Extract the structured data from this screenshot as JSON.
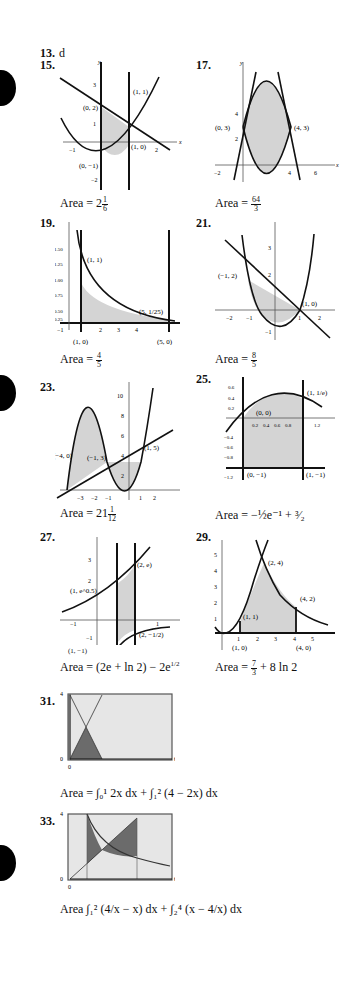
{
  "page": {
    "problems": [
      {
        "id": "13",
        "label": "13.",
        "answer": "d"
      },
      {
        "id": "15",
        "label": "15.",
        "area_prefix": "Area = ",
        "area_whole": "2",
        "area_num": "1",
        "area_den": "6",
        "points": [
          "(0, 2)",
          "(1, 1)",
          "(1, 0)",
          "(0, −1)"
        ],
        "xticks": [
          "−1",
          "2"
        ],
        "yticks": [
          "3",
          "1",
          "−2"
        ]
      },
      {
        "id": "17",
        "label": "17.",
        "area_prefix": "Area = ",
        "area_num": "64",
        "area_den": "3",
        "points": [
          "(0, 3)",
          "(4, 3)"
        ],
        "xticks": [
          "−2",
          "4",
          "6"
        ],
        "yticks": [
          "4",
          "2"
        ]
      },
      {
        "id": "19",
        "label": "19.",
        "area_prefix": "Area = ",
        "area_num": "4",
        "area_den": "5",
        "points": [
          "(1, 1)",
          "(5, 1/25)",
          "(1, 0)",
          "(5, 0)"
        ],
        "xticks": [
          "−1",
          "2",
          "3",
          "4"
        ],
        "yticks": [
          "1.50",
          "1.25",
          "1.00",
          "0.75",
          "0.50",
          "0.25"
        ]
      },
      {
        "id": "21",
        "label": "21.",
        "area_prefix": "Area = ",
        "area_num": "8",
        "area_den": "5",
        "points": [
          "(−1, 2)",
          "(1, 0)"
        ],
        "xticks": [
          "−2",
          "−1",
          "1",
          "2"
        ],
        "yticks": [
          "3",
          "2",
          "−1"
        ]
      },
      {
        "id": "23",
        "label": "23.",
        "area_prefix": "Area = ",
        "area_whole": "21",
        "area_num": "1",
        "area_den": "12",
        "points": [
          "(−4, 0)",
          "(−1, 3)",
          "(1, 5)"
        ],
        "xticks": [
          "−3",
          "−2",
          "−1",
          "1",
          "2"
        ],
        "yticks": [
          "10",
          "8",
          "6",
          "4",
          "2"
        ]
      },
      {
        "id": "25",
        "label": "25.",
        "area_text": "Area = −½e⁻¹ + ³⁄₂",
        "points": [
          "(0, 0)",
          "(1, 1/e)",
          "(0, −1)",
          "(1, −1)"
        ],
        "xticks": [
          "0.2",
          "0.4",
          "0.6",
          "0.8",
          "1.2"
        ],
        "yticks": [
          "0.6",
          "0.4",
          "0.2",
          "−0.4",
          "−0.6",
          "−0.8",
          "−1.2"
        ]
      },
      {
        "id": "27",
        "label": "27.",
        "area_text": "Area = (2e + ln 2) − 2e",
        "area_sup": "1/2",
        "points": [
          "(2, e)",
          "(1, e^0.5)",
          "(2, −1/2)",
          "(1, −1)"
        ],
        "xticks": [
          "−1",
          "1"
        ],
        "yticks": [
          "3",
          "2",
          "−1"
        ]
      },
      {
        "id": "29",
        "label": "29.",
        "area_prefix": "Area = ",
        "area_num": "7",
        "area_den": "3",
        "area_suffix": " + 8 ln 2",
        "points": [
          "(2, 4)",
          "(4, 2)",
          "(1, 1)",
          "(1, 0)",
          "(4, 0)"
        ],
        "xticks": [
          "1",
          "2",
          "3",
          "4",
          "5"
        ],
        "yticks": [
          "5",
          "4",
          "3",
          "2",
          "1"
        ]
      },
      {
        "id": "31",
        "label": "31.",
        "area_text": "Area = ∫₀¹ 2x dx + ∫₁² (4 − 2x) dx",
        "window": {
          "xmin": "0",
          "xmax": "6",
          "ymin": "0",
          "ymax": "4"
        }
      },
      {
        "id": "33",
        "label": "33.",
        "area_text": "Area ∫₁² (4/x − x) dx + ∫₂⁴ (x − 4/x) dx",
        "window": {
          "xmin": "0",
          "xmax": "6",
          "ymin": "0",
          "ymax": "4"
        }
      }
    ]
  },
  "colors": {
    "shade": "#d4d4d4",
    "calc_bg": "#e6e6e6",
    "calc_fill": "#6b6b6b",
    "ink": "#111111"
  }
}
